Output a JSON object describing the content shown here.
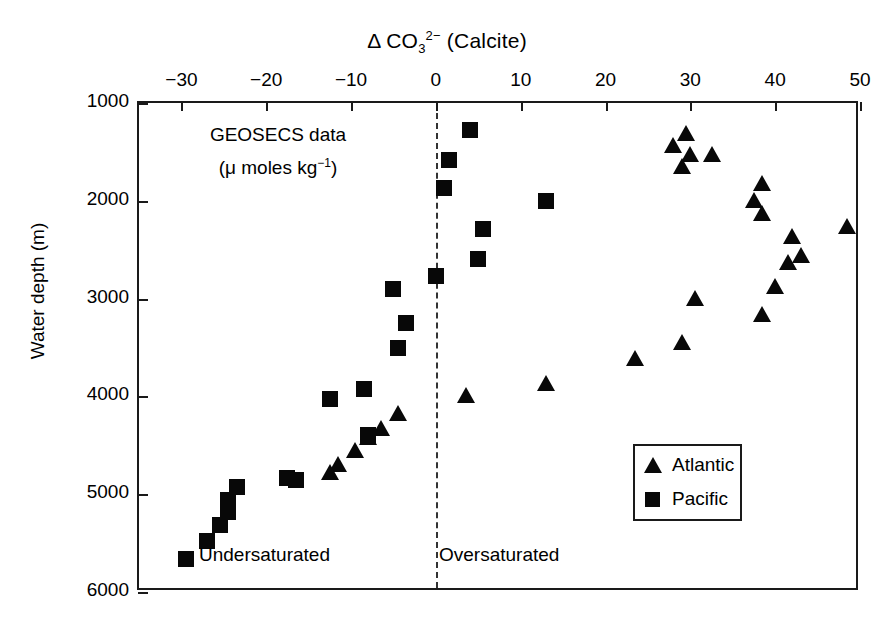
{
  "chart_data": {
    "type": "scatter",
    "title_parts": {
      "delta": "Δ CO",
      "sub": "3",
      "sup": "2−",
      "tail": " (Calcite)"
    },
    "xlabel": "Δ CO3 2- (Calcite)",
    "ylabel": "Water depth (m)",
    "xlim": [
      -35,
      50
    ],
    "ylim": [
      6000,
      1000
    ],
    "y_inverted": true,
    "grid": false,
    "legend_position": "bottom-right",
    "xticks": [
      -30,
      -20,
      -10,
      0,
      10,
      20,
      30,
      40,
      50
    ],
    "xticklabels": [
      "−30",
      "−20",
      "−10",
      "0",
      "10",
      "20",
      "30",
      "40",
      "50"
    ],
    "yticks": [
      1000,
      2000,
      3000,
      4000,
      5000,
      6000
    ],
    "yticklabels": [
      "1000",
      "2000",
      "3000",
      "4000",
      "5000",
      "6000"
    ],
    "reference_lines": [
      {
        "name": "saturation-horizon",
        "x": 0,
        "style": "dashed"
      }
    ],
    "annotations": [
      {
        "name": "geosecs-note-line1",
        "text": "GEOSECS data"
      },
      {
        "name": "geosecs-note-line2",
        "text": "(μ moles kg",
        "sup": "−1",
        "tail": ")"
      },
      {
        "name": "undersaturated-label",
        "text": "Undersaturated"
      },
      {
        "name": "oversaturated-label",
        "text": "Oversaturated"
      }
    ],
    "series": [
      {
        "name": "Atlantic",
        "marker": "triangle",
        "color": "#080808",
        "points": [
          [
            28.0,
            1440
          ],
          [
            29.5,
            1320
          ],
          [
            30.0,
            1530
          ],
          [
            32.5,
            1530
          ],
          [
            29.0,
            1650
          ],
          [
            38.5,
            1830
          ],
          [
            37.5,
            2000
          ],
          [
            38.5,
            2130
          ],
          [
            42.0,
            2370
          ],
          [
            48.5,
            2270
          ],
          [
            43.0,
            2560
          ],
          [
            41.5,
            2640
          ],
          [
            40.0,
            2880
          ],
          [
            30.5,
            3000
          ],
          [
            38.5,
            3170
          ],
          [
            29.0,
            3450
          ],
          [
            23.5,
            3620
          ],
          [
            13.0,
            3870
          ],
          [
            3.5,
            4000
          ],
          [
            -4.5,
            4180
          ],
          [
            -6.5,
            4330
          ],
          [
            -8.0,
            4430
          ],
          [
            -9.5,
            4560
          ],
          [
            -11.5,
            4700
          ],
          [
            -12.5,
            4780
          ]
        ]
      },
      {
        "name": "Pacific",
        "marker": "square",
        "color": "#080808",
        "points": [
          [
            4.0,
            1280
          ],
          [
            1.5,
            1580
          ],
          [
            1.0,
            1870
          ],
          [
            13.0,
            2000
          ],
          [
            5.5,
            2290
          ],
          [
            5.0,
            2600
          ],
          [
            0.0,
            2770
          ],
          [
            -5.0,
            2900
          ],
          [
            -3.5,
            3250
          ],
          [
            -4.5,
            3500
          ],
          [
            -8.5,
            3920
          ],
          [
            -12.5,
            4030
          ],
          [
            -8.0,
            4390
          ],
          [
            -17.5,
            4830
          ],
          [
            -16.5,
            4850
          ],
          [
            -23.5,
            4930
          ],
          [
            -24.5,
            5060
          ],
          [
            -24.5,
            5180
          ],
          [
            -25.5,
            5320
          ],
          [
            -27.0,
            5480
          ],
          [
            -29.5,
            5660
          ]
        ]
      }
    ]
  },
  "legend": {
    "items": [
      {
        "label": "Atlantic",
        "marker": "triangle"
      },
      {
        "label": "Pacific",
        "marker": "square"
      }
    ]
  }
}
